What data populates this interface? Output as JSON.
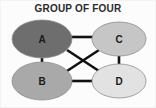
{
  "figure": {
    "title": "GROUP OF FOUR",
    "background_color": "#fcfcfc",
    "border_color": "#f2f2f2",
    "width": 156,
    "height": 108
  },
  "diagram": {
    "type": "graph",
    "edge_color": "#111111",
    "edge_width": 2.6,
    "node_outline_color": "#8e8e8e",
    "label_color": "#1a1a1a",
    "nodes": [
      {
        "id": "A",
        "label": "A",
        "cx": 41,
        "cy": 38,
        "rx": 30,
        "ry": 19,
        "fill": "#6e6e6e"
      },
      {
        "id": "C",
        "label": "C",
        "cx": 118,
        "cy": 38,
        "rx": 27,
        "ry": 17,
        "fill": "#c6c6c6"
      },
      {
        "id": "B",
        "label": "B",
        "cx": 41,
        "cy": 80,
        "rx": 30,
        "ry": 19,
        "fill": "#a9a9a9"
      },
      {
        "id": "D",
        "label": "D",
        "cx": 118,
        "cy": 80,
        "rx": 27,
        "ry": 17,
        "fill": "#e2e2e2"
      }
    ],
    "edges": [
      {
        "id": "A-C",
        "from": "A",
        "to": "C",
        "x1": 70,
        "y1": 36,
        "x2": 92,
        "y2": 36
      },
      {
        "id": "A-B",
        "from": "A",
        "to": "B",
        "x1": 41,
        "y1": 56,
        "x2": 41,
        "y2": 62
      },
      {
        "id": "C-D",
        "from": "C",
        "to": "D",
        "x1": 118,
        "y1": 55,
        "x2": 118,
        "y2": 64
      },
      {
        "id": "B-D",
        "from": "B",
        "to": "D",
        "x1": 70,
        "y1": 80,
        "x2": 92,
        "y2": 80
      },
      {
        "id": "A-D",
        "from": "A",
        "to": "D",
        "x1": 66,
        "y1": 49,
        "x2": 98,
        "y2": 70
      },
      {
        "id": "B-C",
        "from": "B",
        "to": "C",
        "x1": 66,
        "y1": 70,
        "x2": 98,
        "y2": 49
      }
    ]
  }
}
